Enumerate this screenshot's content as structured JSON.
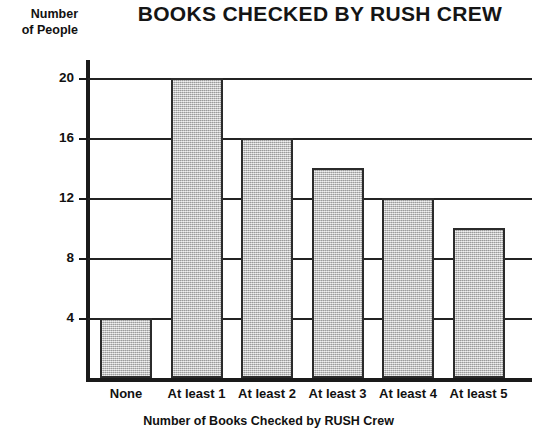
{
  "chart_data": {
    "type": "bar",
    "title": "BOOKS CHECKED BY RUSH CREW",
    "xlabel": "Number of Books Checked by RUSH Crew",
    "ylabel": "Number of People",
    "ylabel_lines": [
      "Number",
      "of People"
    ],
    "categories": [
      "None",
      "At least 1",
      "At least 2",
      "At least 3",
      "At least 4",
      "At least 5"
    ],
    "values": [
      4,
      20,
      16,
      14,
      12,
      10
    ],
    "ylim": [
      0,
      22
    ],
    "yticks": [
      4,
      8,
      12,
      16,
      20
    ],
    "ytick_labels": [
      "4",
      "8",
      "12",
      "16",
      "20"
    ],
    "grid": "horizontal",
    "legend": "none",
    "bar_fill_color": "#c2c2c2",
    "bar_border_color": "#2b2b2b",
    "axis_color": "#1a1a1a"
  }
}
